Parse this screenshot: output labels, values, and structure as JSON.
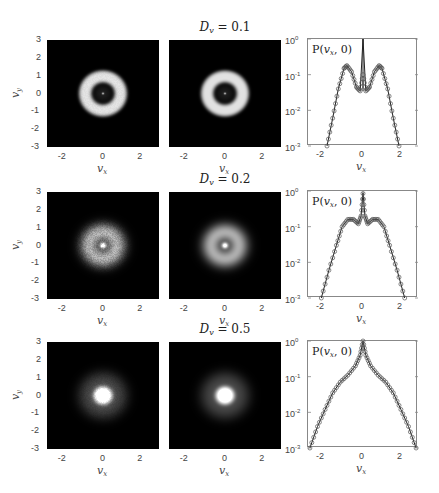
{
  "figure": {
    "rows": [
      {
        "title": {
          "symbol": "D",
          "subscript": "v",
          "equals": "= 0.1"
        },
        "diffusion": 0.1,
        "panel1": {
          "pattern": "ring",
          "ring_radius": 0.95,
          "ring_width": 0.35,
          "center_dot": true,
          "noise": 0.02
        },
        "panel2": {
          "pattern": "ring",
          "ring_radius": 0.95,
          "ring_width": 0.35,
          "center_dot": true,
          "noise": 0.0
        }
      },
      {
        "title": {
          "symbol": "D",
          "subscript": "v",
          "equals": "= 0.2"
        },
        "diffusion": 0.2,
        "panel1": {
          "pattern": "ring-spike",
          "ring_radius": 0.75,
          "ring_width": 0.5,
          "center_spike": true,
          "noise": 0.12
        },
        "panel2": {
          "pattern": "ring-spike",
          "ring_radius": 0.75,
          "ring_width": 0.5,
          "center_spike": true,
          "noise": 0.0
        }
      },
      {
        "title": {
          "symbol": "D",
          "subscript": "v",
          "equals": "= 0.5"
        },
        "diffusion": 0.5,
        "panel1": {
          "pattern": "blob",
          "core_radius": 0.5,
          "halo_radius": 1.3,
          "noise": 0.06
        },
        "panel2": {
          "pattern": "blob",
          "core_radius": 0.5,
          "halo_radius": 1.3,
          "noise": 0.0
        }
      }
    ],
    "image_axes": {
      "xlabel": {
        "symbol": "v",
        "subscript": "x"
      },
      "ylabel": {
        "symbol": "v",
        "subscript": "y"
      },
      "xticks": [
        "-2",
        "0",
        "2"
      ],
      "yticks": [
        "3",
        "2",
        "1",
        "0",
        "-1",
        "-2",
        "-3"
      ],
      "xlim": [
        -3,
        3
      ],
      "ylim": [
        -3,
        3
      ]
    },
    "profile_axes": {
      "legend": {
        "text": "P(",
        "var": "v",
        "sub": "x",
        "tail": ", 0)"
      },
      "xlabel": {
        "symbol": "v",
        "subscript": "x"
      },
      "xticks": [
        "-2",
        "0",
        "2"
      ],
      "yticks": [
        {
          "base": "10",
          "exp": "0"
        },
        {
          "base": "10",
          "exp": "-1"
        },
        {
          "base": "10",
          "exp": "-2"
        },
        {
          "base": "10",
          "exp": "-3"
        }
      ]
    }
  },
  "chart_data": [
    {
      "type": "heatmap",
      "title": "D_v = 0.1 (simulation)",
      "xlabel": "v_x",
      "ylabel": "v_y",
      "xlim": [
        -3,
        3
      ],
      "ylim": [
        -3,
        3
      ],
      "description": "Bright annulus of radius ~1 centered at origin with dark interior and small bright center point"
    },
    {
      "type": "heatmap",
      "title": "D_v = 0.1 (theory)",
      "xlabel": "v_x",
      "ylabel": "",
      "xlim": [
        -3,
        3
      ],
      "ylim": [
        -3,
        3
      ],
      "description": "Smooth bright annulus of radius ~1"
    },
    {
      "type": "line",
      "title": "D_v = 0.1 P(v_x,0)",
      "xlabel": "v_x",
      "ylabel": "P(v_x,0)",
      "yscale": "log",
      "ylim": [
        0.001,
        1
      ],
      "xlim": [
        -2.9,
        2.9
      ],
      "series": [
        {
          "name": "theory (line)",
          "x": [
            -1.9,
            -1.6,
            -1.3,
            -1.0,
            -0.85,
            -0.6,
            -0.35,
            -0.15,
            0.0,
            0.15,
            0.35,
            0.6,
            0.85,
            1.0,
            1.3,
            1.6,
            1.9
          ],
          "y": [
            0.001,
            0.006,
            0.04,
            0.15,
            0.18,
            0.12,
            0.045,
            0.035,
            1.0,
            0.035,
            0.045,
            0.12,
            0.18,
            0.15,
            0.04,
            0.006,
            0.001
          ]
        },
        {
          "name": "simulation (circles)",
          "x": [
            -1.9,
            -1.6,
            -1.3,
            -1.0,
            -0.85,
            -0.6,
            -0.35,
            -0.15,
            0.0,
            0.15,
            0.35,
            0.6,
            0.85,
            1.0,
            1.3,
            1.6,
            1.9
          ],
          "y": [
            0.001,
            0.006,
            0.04,
            0.15,
            0.18,
            0.12,
            0.045,
            0.035,
            0.1,
            0.035,
            0.045,
            0.12,
            0.18,
            0.15,
            0.04,
            0.006,
            0.001
          ]
        }
      ]
    },
    {
      "type": "heatmap",
      "title": "D_v = 0.2 (simulation)",
      "xlabel": "v_x",
      "ylabel": "v_y",
      "xlim": [
        -3,
        3
      ],
      "ylim": [
        -3,
        3
      ],
      "description": "Noisy diffuse ring radius ~0.75 with bright central spot"
    },
    {
      "type": "heatmap",
      "title": "D_v = 0.2 (theory)",
      "xlabel": "v_x",
      "ylabel": "",
      "xlim": [
        -3,
        3
      ],
      "ylim": [
        -3,
        3
      ],
      "description": "Smooth diffuse ring with bright central spot"
    },
    {
      "type": "line",
      "title": "D_v = 0.2 P(v_x,0)",
      "xlabel": "v_x",
      "ylabel": "P(v_x,0)",
      "yscale": "log",
      "ylim": [
        0.001,
        1
      ],
      "xlim": [
        -2.9,
        2.9
      ],
      "series": [
        {
          "name": "theory (line)",
          "x": [
            -2.2,
            -1.8,
            -1.4,
            -1.1,
            -0.8,
            -0.5,
            -0.25,
            -0.1,
            0.0,
            0.1,
            0.25,
            0.5,
            0.8,
            1.1,
            1.4,
            1.8,
            2.2
          ],
          "y": [
            0.001,
            0.006,
            0.03,
            0.1,
            0.16,
            0.16,
            0.12,
            0.2,
            0.9,
            0.2,
            0.12,
            0.16,
            0.16,
            0.1,
            0.03,
            0.006,
            0.001
          ]
        },
        {
          "name": "simulation (circles)",
          "x": [
            -2.2,
            -1.8,
            -1.4,
            -1.1,
            -0.8,
            -0.5,
            -0.25,
            -0.1,
            0.0,
            0.1,
            0.25,
            0.5,
            0.8,
            1.1,
            1.4,
            1.8,
            2.2
          ],
          "y": [
            0.001,
            0.006,
            0.03,
            0.1,
            0.16,
            0.16,
            0.12,
            0.2,
            0.85,
            0.2,
            0.12,
            0.16,
            0.16,
            0.1,
            0.03,
            0.006,
            0.001
          ]
        }
      ]
    },
    {
      "type": "heatmap",
      "title": "D_v = 0.5 (simulation)",
      "xlabel": "v_x",
      "ylabel": "v_y",
      "xlim": [
        -3,
        3
      ],
      "ylim": [
        -3,
        3
      ],
      "description": "Bright central blob radius ~0.5 with faint halo to ~1.3"
    },
    {
      "type": "heatmap",
      "title": "D_v = 0.5 (theory)",
      "xlabel": "v_x",
      "ylabel": "",
      "xlim": [
        -3,
        3
      ],
      "ylim": [
        -3,
        3
      ],
      "description": "Smooth bright central blob with halo"
    },
    {
      "type": "line",
      "title": "D_v = 0.5 P(v_x,0)",
      "xlabel": "v_x",
      "ylabel": "P(v_x,0)",
      "yscale": "log",
      "ylim": [
        0.001,
        1
      ],
      "xlim": [
        -2.9,
        2.9
      ],
      "series": [
        {
          "name": "theory (line)",
          "x": [
            -2.8,
            -2.4,
            -2.0,
            -1.6,
            -1.2,
            -0.8,
            -0.4,
            -0.15,
            0.0,
            0.15,
            0.4,
            0.8,
            1.2,
            1.6,
            2.0,
            2.4,
            2.8
          ],
          "y": [
            0.001,
            0.004,
            0.012,
            0.035,
            0.07,
            0.11,
            0.2,
            0.4,
            1.0,
            0.4,
            0.2,
            0.11,
            0.07,
            0.035,
            0.012,
            0.004,
            0.001
          ]
        },
        {
          "name": "simulation (circles)",
          "x": [
            -2.8,
            -2.4,
            -2.0,
            -1.6,
            -1.2,
            -0.8,
            -0.4,
            -0.15,
            0.0,
            0.15,
            0.4,
            0.8,
            1.2,
            1.6,
            2.0,
            2.4,
            2.8
          ],
          "y": [
            0.001,
            0.004,
            0.012,
            0.035,
            0.07,
            0.11,
            0.2,
            0.4,
            1.0,
            0.4,
            0.2,
            0.11,
            0.07,
            0.035,
            0.012,
            0.004,
            0.001
          ]
        }
      ]
    }
  ]
}
